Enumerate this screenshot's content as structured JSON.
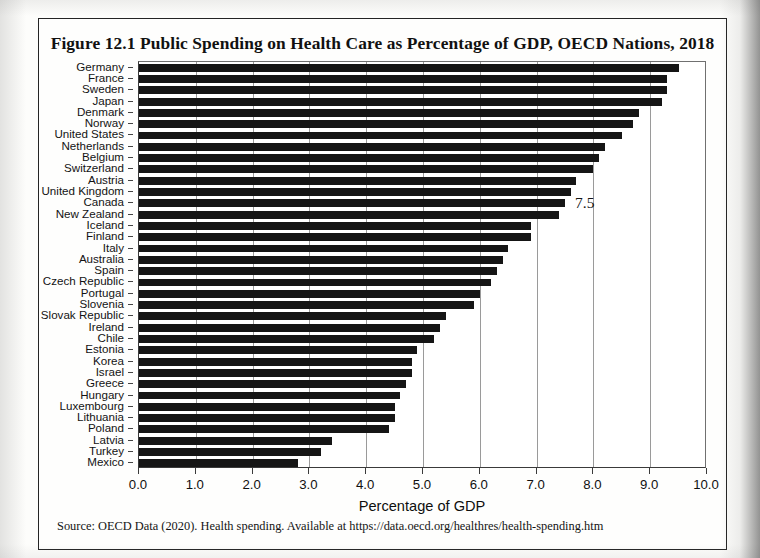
{
  "figure": {
    "title": "Figure 12.1 Public Spending on Health Care as Percentage of GDP, OECD Nations, 2018",
    "source_note": "Source: OECD Data (2020). Health spending. Available at https://data.oecd.org/healthres/health-spending.htm"
  },
  "chart_data": {
    "type": "bar",
    "orientation": "horizontal",
    "title": "Figure 12.1 Public Spending on Health Care as Percentage of GDP, OECD Nations, 2018",
    "xlabel": "Percentage of GDP",
    "ylabel": "",
    "xlim": [
      0.0,
      10.0
    ],
    "xticks": [
      "0.0",
      "1.0",
      "2.0",
      "3.0",
      "4.0",
      "5.0",
      "6.0",
      "7.0",
      "8.0",
      "9.0",
      "10.0"
    ],
    "grid": "vertical",
    "legend": "none",
    "bar_color": "#151515",
    "categories": [
      "Germany",
      "France",
      "Sweden",
      "Japan",
      "Denmark",
      "Norway",
      "United States",
      "Netherlands",
      "Belgium",
      "Switzerland",
      "Austria",
      "United Kingdom",
      "Canada",
      "New Zealand",
      "Iceland",
      "Finland",
      "Italy",
      "Australia",
      "Spain",
      "Czech Republic",
      "Portugal",
      "Slovenia",
      "Slovak Republic",
      "Ireland",
      "Chile",
      "Estonia",
      "Korea",
      "Israel",
      "Greece",
      "Hungary",
      "Luxembourg",
      "Lithuania",
      "Poland",
      "Latvia",
      "Turkey",
      "Mexico"
    ],
    "values": [
      9.5,
      9.3,
      9.3,
      9.2,
      8.8,
      8.7,
      8.5,
      8.2,
      8.1,
      8.0,
      7.7,
      7.6,
      7.5,
      7.4,
      6.9,
      6.9,
      6.5,
      6.4,
      6.3,
      6.2,
      6.0,
      5.9,
      5.4,
      5.3,
      5.2,
      4.9,
      4.8,
      4.8,
      4.7,
      4.6,
      4.5,
      4.5,
      4.4,
      3.4,
      3.2,
      2.8
    ],
    "annotations": [
      {
        "label": "7.5",
        "category": "Canada",
        "value": 7.5
      }
    ]
  }
}
